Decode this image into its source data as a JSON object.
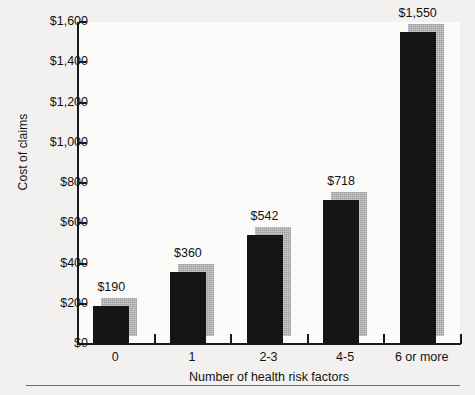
{
  "chart_data": {
    "type": "bar",
    "title": "",
    "xlabel": "Number of health risk factors",
    "ylabel": "Cost of claims",
    "categories": [
      "0",
      "1",
      "2-3",
      "4-5",
      "6 or more"
    ],
    "values": [
      190,
      360,
      542,
      718,
      1550
    ],
    "value_labels": [
      "$190",
      "$360",
      "$542",
      "$718",
      "$1,550"
    ],
    "ylim": [
      0,
      1600
    ],
    "ytick_values": [
      0,
      200,
      400,
      600,
      800,
      1000,
      1200,
      1400,
      1600
    ],
    "ytick_labels": [
      "$0",
      "$200",
      "$400",
      "$600",
      "$800",
      "$1,000",
      "$1,200",
      "$1,400",
      "$1,600"
    ],
    "grid": false,
    "legend": "none",
    "series": [
      {
        "name": "Cost of claims",
        "values": [
          190,
          360,
          542,
          718,
          1550
        ]
      }
    ],
    "colors": {
      "bar_face": "#151515",
      "bar_shadow": "#9d9d9d",
      "axis": "#1a1a1a",
      "plot_background": "#fbfbfa",
      "page_background": "#f2f1ef",
      "text": "#131313"
    }
  }
}
